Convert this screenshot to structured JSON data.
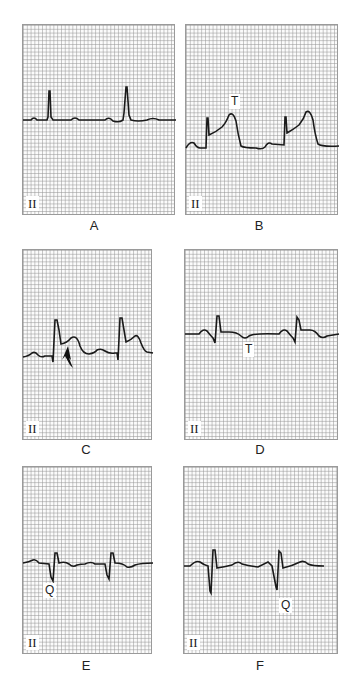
{
  "figure": {
    "panels": [
      {
        "id": "A",
        "caption": "A",
        "lead": "II",
        "annotations": []
      },
      {
        "id": "B",
        "caption": "B",
        "lead": "II",
        "annotations": [
          {
            "text": "T"
          }
        ]
      },
      {
        "id": "C",
        "caption": "C",
        "lead": "II",
        "annotations": [
          {
            "text": "arrow"
          }
        ]
      },
      {
        "id": "D",
        "caption": "D",
        "lead": "II",
        "annotations": [
          {
            "text": "T"
          }
        ]
      },
      {
        "id": "E",
        "caption": "E",
        "lead": "II",
        "annotations": [
          {
            "text": "Q"
          }
        ]
      },
      {
        "id": "F",
        "caption": "F",
        "lead": "II",
        "annotations": [
          {
            "text": "Q"
          }
        ]
      }
    ],
    "colors": {
      "grid": "#aaaaaa",
      "trace": "#1a1a1a",
      "border": "#9a9a9a"
    }
  }
}
